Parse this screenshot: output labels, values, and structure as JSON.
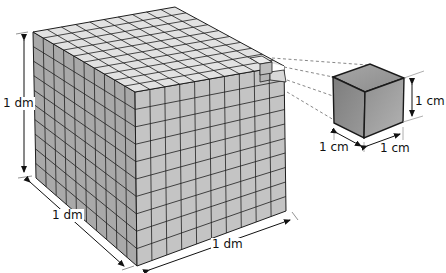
{
  "diagram": {
    "big_cube": {
      "grid_divisions": 10,
      "labels": {
        "height": "1 dm",
        "depth": "1 dm",
        "width": "1 dm"
      },
      "colors": {
        "top": "#e2e2e2",
        "left": "#a9a9a9",
        "right": "#c4c4c4",
        "grid": "#1e1e1e"
      }
    },
    "small_cube": {
      "labels": {
        "height": "1 cm",
        "depth": "1 cm",
        "width": "1 cm"
      },
      "colors": {
        "top": "#9a9a9a",
        "left": "#8a8a8a",
        "right": "#a2a2a2",
        "edge": "#1a1a1a"
      }
    },
    "connector_style": "dashed",
    "connector_color": "#888888"
  }
}
